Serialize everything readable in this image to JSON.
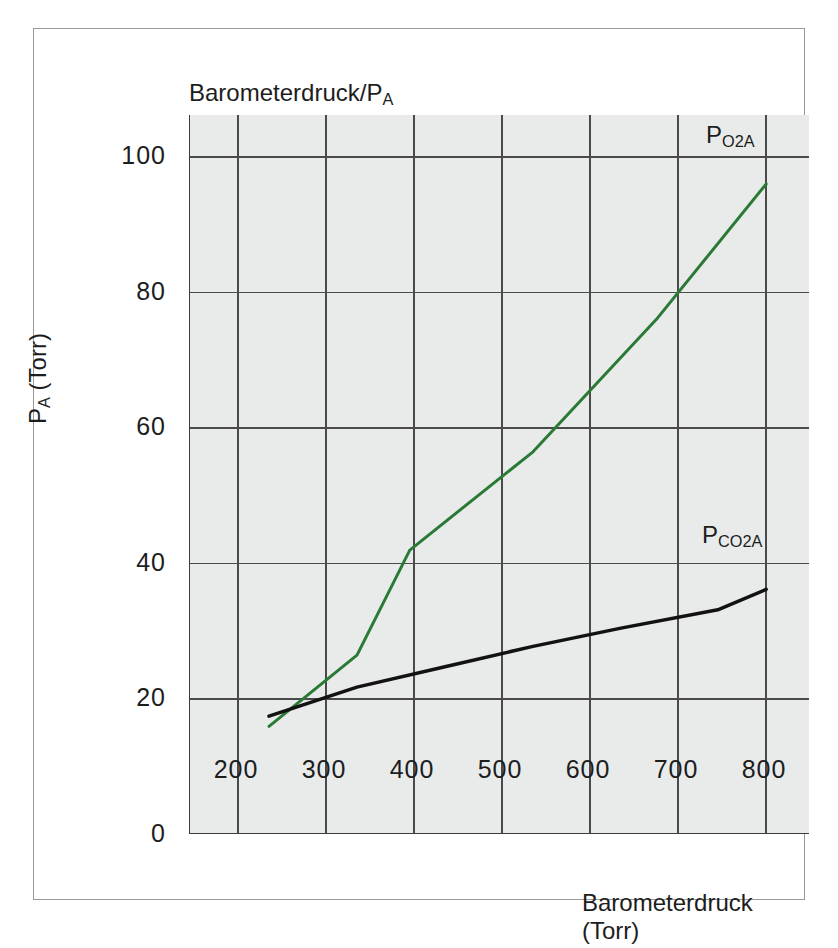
{
  "figure": {
    "top_title": "Barometerdruck/P",
    "top_title_sub": "A",
    "xlabel": "Barometerdruck (Torr)",
    "ylabel_main": "P",
    "ylabel_sub": "A",
    "ylabel_unit": " (Torr)"
  },
  "chart_data": {
    "type": "line",
    "title": "Barometerdruck/PA",
    "xlabel": "Barometerdruck (Torr)",
    "ylabel": "PA (Torr)",
    "xlim": [
      150,
      800
    ],
    "ylim": [
      0,
      107
    ],
    "xticks": [
      200,
      300,
      400,
      500,
      600,
      700,
      800
    ],
    "xticklabels": [
      "200",
      "300",
      "400",
      "500",
      "600",
      "700",
      "800"
    ],
    "yticks": [
      0,
      20,
      40,
      60,
      80,
      100
    ],
    "yticklabels": [
      "0",
      "20",
      "40",
      "60",
      "80",
      "100"
    ],
    "grid": true,
    "grid_color": "#4a4a4a",
    "plot_background": "#e9ebeb",
    "legend_position": "inline-end-of-line",
    "series": [
      {
        "name": "P O2A",
        "label_main": "P",
        "label_sub": "O2A",
        "color": "#2a7a36",
        "linewidth": 3,
        "x": [
          200,
          300,
          360,
          500,
          640,
          765
        ],
        "y": [
          20,
          30.5,
          46,
          60.5,
          80,
          100
        ]
      },
      {
        "name": "P CO2A",
        "label_main": "P",
        "label_sub": "CO2A",
        "color": "#121212",
        "linewidth": 3.5,
        "x": [
          200,
          300,
          400,
          500,
          600,
          710,
          765
        ],
        "y": [
          21.5,
          25.8,
          28.8,
          31.8,
          34.5,
          37.2,
          40.2
        ]
      }
    ]
  }
}
